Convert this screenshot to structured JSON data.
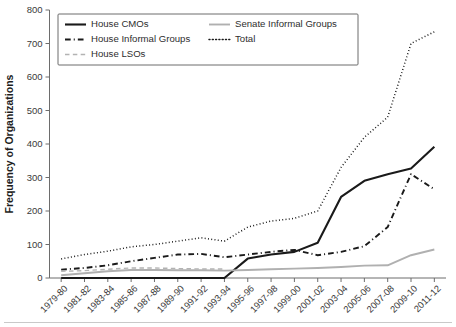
{
  "chart_data": {
    "type": "line",
    "title": "",
    "xlabel": "",
    "ylabel": "Frequency of Organizations",
    "ylim": [
      0,
      800
    ],
    "ytick_step": 100,
    "yticks": [
      "0",
      "100",
      "200",
      "300",
      "400",
      "500",
      "600",
      "700",
      "800"
    ],
    "grid": false,
    "legend_position": "top-left",
    "categories": [
      "1979-80",
      "1981-82",
      "1983-84",
      "1985-86",
      "1987-88",
      "1989-90",
      "1991-92",
      "1993-94",
      "1995-96",
      "1997-98",
      "1999-00",
      "2001-02",
      "2003-04",
      "2005-06",
      "2007-08",
      "2009-10",
      "2011-12"
    ],
    "series": [
      {
        "name": "House CMOs",
        "style": "solid",
        "color": "#1a1a1a",
        "width": 2.1,
        "values": [
          0,
          0,
          0,
          0,
          0,
          0,
          0,
          0,
          58,
          70,
          78,
          105,
          242,
          290,
          310,
          327,
          392
        ]
      },
      {
        "name": "House Informal Groups",
        "style": "dashdot",
        "color": "#1a1a1a",
        "width": 1.9,
        "values": [
          25,
          30,
          38,
          50,
          60,
          70,
          72,
          62,
          70,
          78,
          84,
          68,
          78,
          95,
          152,
          310,
          265
        ]
      },
      {
        "name": "House LSOs",
        "style": "dashed",
        "color": "#b3b3b3",
        "width": 1.4,
        "values": [
          20,
          22,
          26,
          30,
          30,
          28,
          27,
          27,
          null,
          null,
          null,
          null,
          null,
          null,
          null,
          null,
          null
        ]
      },
      {
        "name": "Senate Informal Groups",
        "style": "solid",
        "color": "#b0b0b0",
        "width": 1.9,
        "values": [
          8,
          14,
          20,
          24,
          24,
          23,
          23,
          22,
          24,
          26,
          28,
          30,
          33,
          37,
          38,
          68,
          85
        ]
      },
      {
        "name": "Total",
        "style": "dotted",
        "color": "#1a1a1a",
        "width": 1.5,
        "values": [
          57,
          70,
          80,
          93,
          100,
          110,
          120,
          110,
          152,
          170,
          178,
          200,
          330,
          420,
          480,
          700,
          735
        ]
      }
    ]
  },
  "legend": {
    "entries": [
      {
        "label": "House CMOs"
      },
      {
        "label": "House Informal Groups"
      },
      {
        "label": "House LSOs"
      },
      {
        "label": "Senate Informal Groups"
      },
      {
        "label": "Total"
      }
    ]
  },
  "axes": {
    "y_title": "Frequency of Organizations"
  }
}
